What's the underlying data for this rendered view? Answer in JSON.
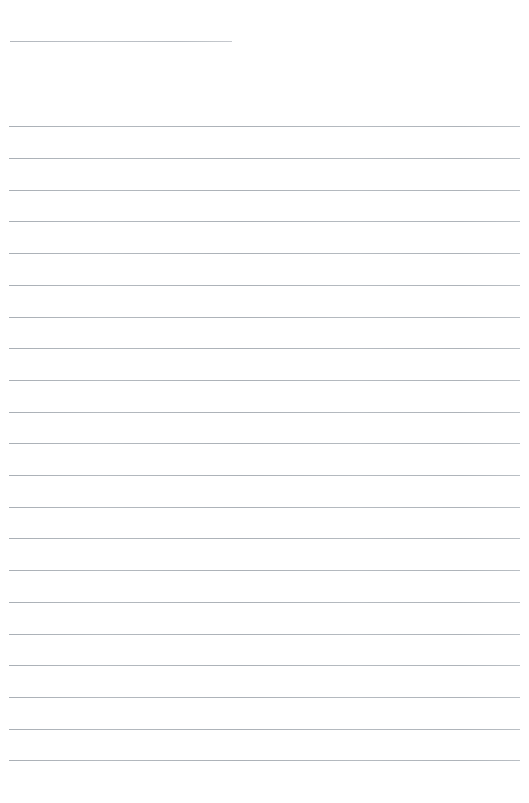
{
  "document": {
    "kind": "ruled-paper-page",
    "title_text": "",
    "body_text": "",
    "page_background_color": "#ffffff",
    "rule_color": "#c2c7cc",
    "header_rule_color": "#c9cdd2",
    "page_width": 529,
    "page_height": 803
  },
  "header_rule": {
    "name": "title-underline",
    "x": 10,
    "y": 41,
    "width": 222,
    "thickness": 1,
    "color": "#c9cdd2"
  },
  "ruled_lines": {
    "count": 21,
    "first_y": 126,
    "spacing": 31.7,
    "x": 9,
    "width": 511,
    "thickness": 1,
    "color": "#c2c7cc",
    "lines": [
      {
        "index": 1,
        "y": 126,
        "x": 9,
        "width": 511,
        "text": ""
      },
      {
        "index": 2,
        "y": 158,
        "x": 9,
        "width": 511,
        "text": ""
      },
      {
        "index": 3,
        "y": 190,
        "x": 9,
        "width": 511,
        "text": ""
      },
      {
        "index": 4,
        "y": 221,
        "x": 9,
        "width": 511,
        "text": ""
      },
      {
        "index": 5,
        "y": 253,
        "x": 9,
        "width": 511,
        "text": ""
      },
      {
        "index": 6,
        "y": 285,
        "x": 9,
        "width": 511,
        "text": ""
      },
      {
        "index": 7,
        "y": 317,
        "x": 9,
        "width": 511,
        "text": ""
      },
      {
        "index": 8,
        "y": 348,
        "x": 9,
        "width": 511,
        "text": ""
      },
      {
        "index": 9,
        "y": 380,
        "x": 9,
        "width": 511,
        "text": ""
      },
      {
        "index": 10,
        "y": 412,
        "x": 9,
        "width": 511,
        "text": ""
      },
      {
        "index": 11,
        "y": 443,
        "x": 9,
        "width": 511,
        "text": ""
      },
      {
        "index": 12,
        "y": 475,
        "x": 9,
        "width": 511,
        "text": ""
      },
      {
        "index": 13,
        "y": 507,
        "x": 9,
        "width": 511,
        "text": ""
      },
      {
        "index": 14,
        "y": 538,
        "x": 9,
        "width": 511,
        "text": ""
      },
      {
        "index": 15,
        "y": 570,
        "x": 9,
        "width": 511,
        "text": ""
      },
      {
        "index": 16,
        "y": 602,
        "x": 9,
        "width": 511,
        "text": ""
      },
      {
        "index": 17,
        "y": 634,
        "x": 9,
        "width": 511,
        "text": ""
      },
      {
        "index": 18,
        "y": 665,
        "x": 9,
        "width": 511,
        "text": ""
      },
      {
        "index": 19,
        "y": 697,
        "x": 9,
        "width": 511,
        "text": ""
      },
      {
        "index": 20,
        "y": 729,
        "x": 9,
        "width": 511,
        "text": ""
      },
      {
        "index": 21,
        "y": 760,
        "x": 9,
        "width": 511,
        "text": ""
      }
    ]
  }
}
